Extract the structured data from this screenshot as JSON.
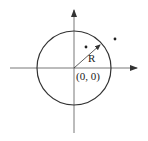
{
  "diagram": {
    "type": "circle-on-axes",
    "labels": {
      "radius": "R",
      "origin": "(0, 0)"
    },
    "elements": {
      "x_axis": {
        "x1": 10,
        "y1": 68,
        "x2": 137,
        "y2": 68,
        "arrow": "right"
      },
      "y_axis": {
        "x1": 74,
        "y1": 133,
        "x2": 74,
        "y2": 10,
        "arrow": "up"
      },
      "circle": {
        "cx": 74,
        "cy": 68,
        "r": 37
      },
      "radius_arrow": {
        "x1": 74,
        "y1": 68,
        "x2": 100,
        "y2": 45
      },
      "point_inside": {
        "cx": 86,
        "cy": 47
      },
      "point_outside": {
        "cx": 115,
        "cy": 39
      }
    },
    "colors": {
      "stroke": "#333333",
      "background": "#ffffff"
    }
  }
}
